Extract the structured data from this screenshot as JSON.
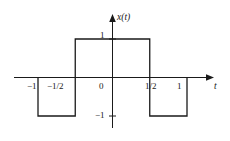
{
  "figure": {
    "kind": "signal-plot",
    "background_color": "#ffffff",
    "line_color": "#1a1a1a"
  },
  "axes": {
    "x_axis_label": "t",
    "y_axis_label": "x(t)",
    "x_ticks": [
      {
        "value": -1,
        "label": "−1"
      },
      {
        "value": -0.5,
        "label": "−1/2"
      },
      {
        "value": 0,
        "label": "0"
      },
      {
        "value": 0.5,
        "label": "1/2"
      },
      {
        "value": 1,
        "label": "1"
      }
    ],
    "y_ticks": [
      {
        "value": 1,
        "label": "1"
      },
      {
        "value": -1,
        "label": "−1"
      }
    ]
  },
  "chart_data": {
    "type": "line",
    "title": "",
    "xlabel": "t",
    "ylabel": "x(t)",
    "xlim": [
      -1.35,
      1.45
    ],
    "ylim": [
      -1.45,
      1.45
    ],
    "grid": false,
    "legend": null,
    "series": [
      {
        "name": "x(t)",
        "description": "Square wave: -1 on [-1,-1/2], +1 on [-1/2,1/2], -1 on [1/2,1]",
        "x": [
          -1,
          -1,
          -0.5,
          -0.5,
          0.5,
          0.5,
          1,
          1
        ],
        "y": [
          0,
          -1,
          -1,
          1,
          1,
          -1,
          -1,
          0
        ]
      }
    ],
    "xticks": [
      -1,
      -0.5,
      0,
      0.5,
      1
    ],
    "xticklabels": [
      "−1",
      "−1/2",
      "0",
      "1/2",
      "1"
    ],
    "yticks": [
      -1,
      1
    ],
    "yticklabels": [
      "−1",
      "1"
    ]
  }
}
